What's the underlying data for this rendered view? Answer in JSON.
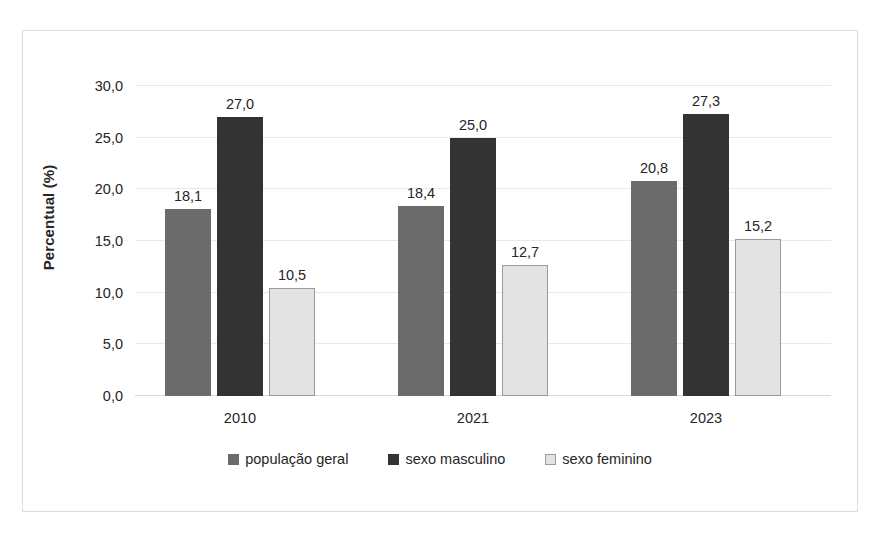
{
  "chart_data": {
    "type": "bar",
    "title": "",
    "subtitle": "",
    "xlabel": "",
    "ylabel": "Percentual (%)",
    "categories": [
      "2010",
      "2021",
      "2023"
    ],
    "series": [
      {
        "name": "população geral",
        "color": "#6b6b6b",
        "border": "#6b6b6b",
        "values": [
          18.1,
          18.4,
          20.8
        ],
        "labels": [
          "18,1",
          "18,4",
          "20,8"
        ]
      },
      {
        "name": "sexo masculino",
        "color": "#333333",
        "border": "#333333",
        "values": [
          27.0,
          25.0,
          27.3
        ],
        "labels": [
          "27,0",
          "25,0",
          "27,3"
        ]
      },
      {
        "name": "sexo feminino",
        "color": "#e3e3e3",
        "border": "#9a9a9a",
        "values": [
          10.5,
          12.7,
          15.2
        ],
        "labels": [
          "10,5",
          "12,7",
          "15,2"
        ]
      }
    ],
    "ylim": [
      0,
      30
    ],
    "ytick_step": 5,
    "ytick_labels": [
      "0,0",
      "5,0",
      "10,0",
      "15,0",
      "20,0",
      "25,0",
      "30,0"
    ],
    "ytick_values": [
      0,
      5,
      10,
      15,
      20,
      25,
      30
    ],
    "grid": true,
    "legend_position": "bottom",
    "decimal_separator": ","
  },
  "frame": {
    "border_color": "#dcdcdc",
    "background": "#ffffff"
  },
  "gridline_color": "#e8e8e8"
}
